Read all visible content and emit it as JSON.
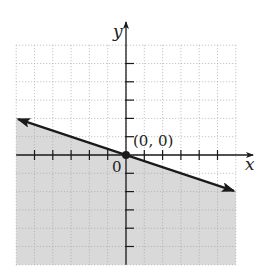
{
  "chart_data": {
    "type": "line",
    "title": "",
    "xlabel": "x",
    "ylabel": "y",
    "xlim": [
      -6,
      6
    ],
    "ylim": [
      -6,
      6
    ],
    "grid": true,
    "origin_label": "0",
    "series": [
      {
        "name": "boundary line y = -x/3",
        "style": "solid",
        "x": [
          -6,
          6
        ],
        "values": [
          2,
          -2
        ]
      }
    ],
    "shaded_region": "below boundary line (y <= -x/3)",
    "points": [
      {
        "label": "(0, 0)",
        "x": 0,
        "y": 0
      }
    ],
    "x_ticks": [
      -5,
      -4,
      -3,
      -2,
      -1,
      1,
      2,
      3,
      4,
      5
    ],
    "y_ticks": [
      -5,
      -4,
      -3,
      -2,
      -1,
      1,
      2,
      3,
      4,
      5
    ]
  },
  "labels": {
    "x_axis": "x",
    "y_axis": "y",
    "origin": "0",
    "point": "(0, 0)"
  },
  "colors": {
    "shade": "#d9d9d9",
    "grid": "#a8a8a8",
    "axis": "#1a1a1a",
    "line": "#1a1a1a"
  }
}
